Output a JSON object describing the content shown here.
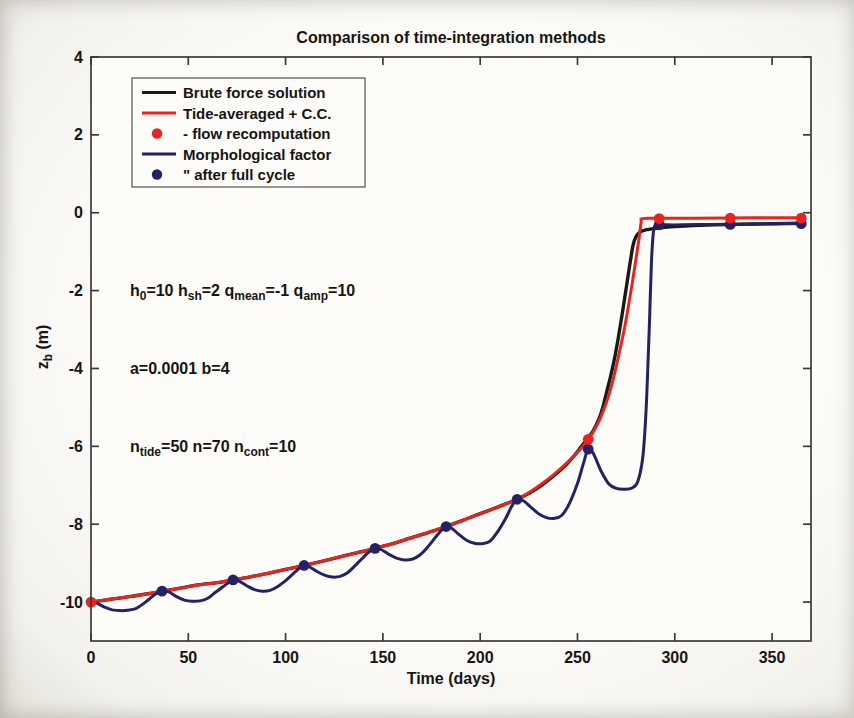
{
  "chart_data": {
    "type": "line",
    "title": "Comparison of time-integration methods",
    "xlabel": "Time (days)",
    "ylabel": "z_b (m)",
    "ylabel_segments": [
      {
        "t": "z"
      },
      {
        "sub": "b"
      },
      {
        "t": " (m)"
      }
    ],
    "xlim": [
      0,
      370
    ],
    "ylim": [
      -11,
      4
    ],
    "xticks": [
      0,
      50,
      100,
      150,
      200,
      250,
      300,
      350
    ],
    "yticks": [
      4,
      2,
      0,
      -2,
      -4,
      -6,
      -8,
      -10
    ],
    "grid": false,
    "axis_color": "#3b3a38",
    "legend_position": "upper-left",
    "legend": [
      {
        "label": "Brute force solution",
        "type": "line",
        "color": "#1b1815"
      },
      {
        "label": "Tide-averaged + C.C.",
        "type": "line",
        "color": "#e8241f"
      },
      {
        "label": "- flow recomputation",
        "type": "dot",
        "color": "#e8241f"
      },
      {
        "label": "Morphological factor",
        "type": "line",
        "color": "#232266"
      },
      {
        "label": "\" after full cycle",
        "type": "dot",
        "color": "#232266"
      }
    ],
    "annotations": [
      {
        "x": 20,
        "y": -2,
        "segments": [
          {
            "t": "h"
          },
          {
            "sub": "0"
          },
          {
            "t": "=10 h"
          },
          {
            "sub": "sh"
          },
          {
            "t": "=2 q"
          },
          {
            "sub": "mean"
          },
          {
            "t": "=-1 q"
          },
          {
            "sub": "amp"
          },
          {
            "t": "=10"
          }
        ]
      },
      {
        "x": 20,
        "y": -4,
        "segments": [
          {
            "t": "a=0.0001 b=4"
          }
        ]
      },
      {
        "x": 20,
        "y": -6,
        "segments": [
          {
            "t": "n"
          },
          {
            "sub": "tide"
          },
          {
            "t": "=50 n=70 n"
          },
          {
            "sub": "cont"
          },
          {
            "t": "=10"
          }
        ]
      }
    ],
    "series": [
      {
        "name": "Brute force solution",
        "color": "#1b1815",
        "width": 3.4,
        "points": [
          [
            0,
            -10
          ],
          [
            10,
            -9.93
          ],
          [
            20,
            -9.86
          ],
          [
            30,
            -9.78
          ],
          [
            36.5,
            -9.72
          ],
          [
            45,
            -9.65
          ],
          [
            55,
            -9.56
          ],
          [
            65,
            -9.5
          ],
          [
            73,
            -9.43
          ],
          [
            82,
            -9.35
          ],
          [
            91,
            -9.26
          ],
          [
            100,
            -9.16
          ],
          [
            109.5,
            -9.06
          ],
          [
            118,
            -8.96
          ],
          [
            127,
            -8.85
          ],
          [
            137,
            -8.73
          ],
          [
            146,
            -8.62
          ],
          [
            155,
            -8.5
          ],
          [
            164,
            -8.36
          ],
          [
            173,
            -8.22
          ],
          [
            182.5,
            -8.06
          ],
          [
            191,
            -7.9
          ],
          [
            200,
            -7.73
          ],
          [
            210,
            -7.54
          ],
          [
            219,
            -7.36
          ],
          [
            226,
            -7.18
          ],
          [
            232,
            -6.98
          ],
          [
            238,
            -6.75
          ],
          [
            244,
            -6.48
          ],
          [
            249,
            -6.2
          ],
          [
            252,
            -6.0
          ],
          [
            255,
            -5.82
          ],
          [
            258,
            -5.6
          ],
          [
            261,
            -5.3
          ],
          [
            263,
            -5.0
          ],
          [
            265,
            -4.6
          ],
          [
            267,
            -4.2
          ],
          [
            269,
            -3.75
          ],
          [
            271,
            -3.2
          ],
          [
            273,
            -2.6
          ],
          [
            275,
            -1.95
          ],
          [
            277,
            -1.3
          ],
          [
            278.5,
            -0.85
          ],
          [
            280,
            -0.62
          ],
          [
            282,
            -0.5
          ],
          [
            285,
            -0.44
          ],
          [
            290,
            -0.4
          ],
          [
            296,
            -0.37
          ],
          [
            305,
            -0.34
          ],
          [
            320,
            -0.31
          ],
          [
            340,
            -0.29
          ],
          [
            366,
            -0.27
          ]
        ]
      },
      {
        "name": "Tide-averaged + C.C.",
        "color": "#e8241f",
        "width": 3.0,
        "points": [
          [
            0,
            -10
          ],
          [
            10,
            -9.93
          ],
          [
            20,
            -9.86
          ],
          [
            30,
            -9.78
          ],
          [
            36.5,
            -9.72
          ],
          [
            45,
            -9.65
          ],
          [
            55,
            -9.56
          ],
          [
            65,
            -9.5
          ],
          [
            73,
            -9.43
          ],
          [
            82,
            -9.35
          ],
          [
            91,
            -9.26
          ],
          [
            100,
            -9.16
          ],
          [
            109.5,
            -9.06
          ],
          [
            118,
            -8.96
          ],
          [
            127,
            -8.85
          ],
          [
            137,
            -8.73
          ],
          [
            146,
            -8.62
          ],
          [
            155,
            -8.5
          ],
          [
            164,
            -8.36
          ],
          [
            173,
            -8.22
          ],
          [
            182.5,
            -8.06
          ],
          [
            191,
            -7.9
          ],
          [
            200,
            -7.73
          ],
          [
            210,
            -7.54
          ],
          [
            219,
            -7.36
          ],
          [
            226,
            -7.16
          ],
          [
            232,
            -6.95
          ],
          [
            238,
            -6.72
          ],
          [
            244,
            -6.45
          ],
          [
            250,
            -6.15
          ],
          [
            255.5,
            -5.83
          ],
          [
            259,
            -5.55
          ],
          [
            262,
            -5.25
          ],
          [
            265,
            -4.85
          ],
          [
            268,
            -4.35
          ],
          [
            271,
            -3.7
          ],
          [
            274,
            -3.0
          ],
          [
            276,
            -2.45
          ],
          [
            278,
            -1.85
          ],
          [
            280,
            -1.2
          ],
          [
            281.5,
            -0.7
          ],
          [
            282.7,
            -0.25
          ],
          [
            283.2,
            -0.15
          ],
          [
            290,
            -0.14
          ],
          [
            310,
            -0.14
          ],
          [
            340,
            -0.13
          ],
          [
            366,
            -0.13
          ]
        ]
      },
      {
        "name": "Morphological factor",
        "color": "#232266",
        "width": 3.0,
        "points": [
          [
            0,
            -10
          ],
          [
            3,
            -10.03
          ],
          [
            7,
            -10.13
          ],
          [
            11,
            -10.2
          ],
          [
            15,
            -10.22
          ],
          [
            19,
            -10.21
          ],
          [
            23,
            -10.17
          ],
          [
            27,
            -10.04
          ],
          [
            30,
            -9.92
          ],
          [
            33,
            -9.8
          ],
          [
            36.5,
            -9.72
          ],
          [
            40,
            -9.74
          ],
          [
            44,
            -9.86
          ],
          [
            48,
            -9.95
          ],
          [
            52,
            -9.98
          ],
          [
            56,
            -9.97
          ],
          [
            60,
            -9.9
          ],
          [
            64,
            -9.75
          ],
          [
            68,
            -9.6
          ],
          [
            71,
            -9.49
          ],
          [
            73,
            -9.43
          ],
          [
            76,
            -9.46
          ],
          [
            80,
            -9.58
          ],
          [
            84,
            -9.68
          ],
          [
            88,
            -9.72
          ],
          [
            92,
            -9.7
          ],
          [
            96,
            -9.6
          ],
          [
            100,
            -9.45
          ],
          [
            104,
            -9.27
          ],
          [
            107,
            -9.13
          ],
          [
            109.5,
            -9.06
          ],
          [
            112,
            -9.09
          ],
          [
            116,
            -9.21
          ],
          [
            120,
            -9.31
          ],
          [
            124,
            -9.36
          ],
          [
            128,
            -9.34
          ],
          [
            132,
            -9.24
          ],
          [
            136,
            -9.05
          ],
          [
            140,
            -8.85
          ],
          [
            143,
            -8.71
          ],
          [
            146,
            -8.62
          ],
          [
            149,
            -8.65
          ],
          [
            153,
            -8.77
          ],
          [
            157,
            -8.87
          ],
          [
            161,
            -8.92
          ],
          [
            165,
            -8.9
          ],
          [
            169,
            -8.79
          ],
          [
            173,
            -8.59
          ],
          [
            177,
            -8.34
          ],
          [
            180,
            -8.16
          ],
          [
            182.5,
            -8.06
          ],
          [
            185,
            -8.09
          ],
          [
            189,
            -8.26
          ],
          [
            193,
            -8.41
          ],
          [
            197,
            -8.49
          ],
          [
            201,
            -8.5
          ],
          [
            205,
            -8.44
          ],
          [
            209,
            -8.19
          ],
          [
            213,
            -7.86
          ],
          [
            216,
            -7.56
          ],
          [
            219,
            -7.36
          ],
          [
            222,
            -7.39
          ],
          [
            226,
            -7.56
          ],
          [
            230,
            -7.73
          ],
          [
            234,
            -7.83
          ],
          [
            238,
            -7.85
          ],
          [
            242,
            -7.77
          ],
          [
            246,
            -7.45
          ],
          [
            250,
            -6.95
          ],
          [
            253,
            -6.45
          ],
          [
            255.5,
            -6.07
          ],
          [
            258,
            -6.17
          ],
          [
            262,
            -6.62
          ],
          [
            266,
            -6.96
          ],
          [
            270,
            -7.08
          ],
          [
            274,
            -7.1
          ],
          [
            278,
            -7.07
          ],
          [
            281,
            -6.9
          ],
          [
            283.5,
            -6.3
          ],
          [
            285,
            -5.3
          ],
          [
            286,
            -4.2
          ],
          [
            287,
            -2.8
          ],
          [
            288,
            -1.3
          ],
          [
            288.8,
            -0.6
          ],
          [
            289.6,
            -0.35
          ],
          [
            291,
            -0.28
          ],
          [
            292,
            -0.3
          ],
          [
            296,
            -0.31
          ],
          [
            304,
            -0.31
          ],
          [
            316,
            -0.3
          ],
          [
            328.5,
            -0.3
          ],
          [
            344,
            -0.29
          ],
          [
            356,
            -0.28
          ],
          [
            366,
            -0.28
          ]
        ]
      }
    ],
    "markers": [
      {
        "name": "flow recomputation",
        "color": "#e8241f",
        "r": 5.4,
        "points": [
          [
            0,
            -10
          ],
          [
            255.5,
            -5.82
          ],
          [
            292,
            -0.15
          ],
          [
            328.5,
            -0.14
          ],
          [
            365,
            -0.14
          ]
        ]
      },
      {
        "name": "after full cycle",
        "color": "#232266",
        "r": 5.4,
        "points": [
          [
            36.5,
            -9.72
          ],
          [
            73,
            -9.43
          ],
          [
            109.5,
            -9.06
          ],
          [
            146,
            -8.62
          ],
          [
            182.5,
            -8.06
          ],
          [
            219,
            -7.36
          ],
          [
            255.5,
            -6.07
          ],
          [
            292,
            -0.31
          ],
          [
            328.5,
            -0.3
          ],
          [
            365,
            -0.28
          ]
        ]
      }
    ]
  }
}
